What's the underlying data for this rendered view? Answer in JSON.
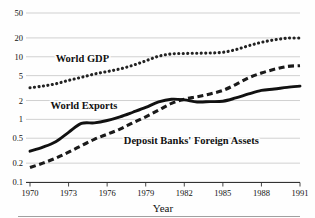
{
  "figure": {
    "caption_clipped": "",
    "footer_rule": true
  },
  "chart_data": {
    "type": "line",
    "title": "",
    "xlabel": "Year",
    "ylabel": "",
    "yscale": "log",
    "ylim": [
      0.1,
      50
    ],
    "xlim": [
      1970,
      1991
    ],
    "grid": true,
    "grid_axis": "y",
    "legend": "inline-labels",
    "yticks": [
      0.1,
      0.2,
      0.5,
      1,
      2,
      5,
      10,
      20,
      50
    ],
    "ytick_labels": [
      "0.1",
      "0.2",
      "0.5",
      "1",
      "2",
      "5",
      "10",
      "20",
      "50"
    ],
    "xticks": [
      1970,
      1973,
      1976,
      1979,
      1982,
      1985,
      1988,
      1991
    ],
    "xtick_labels": [
      "1970",
      "1973",
      "1976",
      "1979",
      "1982",
      "1985",
      "1988",
      "1991"
    ],
    "x": [
      1970,
      1971,
      1972,
      1973,
      1974,
      1975,
      1976,
      1977,
      1978,
      1979,
      1980,
      1981,
      1982,
      1983,
      1984,
      1985,
      1986,
      1987,
      1988,
      1989,
      1990,
      1991
    ],
    "series": [
      {
        "name": "World GDP",
        "style": "dotted",
        "color": "#222222",
        "label_x": 1972.0,
        "label_y": 8.2,
        "values": [
          3.2,
          3.4,
          3.7,
          4.2,
          4.7,
          5.3,
          5.8,
          6.4,
          7.3,
          8.6,
          10.2,
          11.1,
          11.3,
          11.4,
          11.5,
          11.8,
          13.0,
          15.0,
          17.0,
          18.6,
          19.8,
          20.0
        ]
      },
      {
        "name": "Deposit Banks' Foreign Assets",
        "style": "dashed",
        "color": "#1a1a1a",
        "label_x": 1977.3,
        "label_y": 0.4,
        "values": [
          0.17,
          0.2,
          0.24,
          0.3,
          0.38,
          0.48,
          0.58,
          0.7,
          0.88,
          1.1,
          1.4,
          1.8,
          2.1,
          2.3,
          2.55,
          2.9,
          3.6,
          4.6,
          5.5,
          6.3,
          7.0,
          7.2
        ]
      },
      {
        "name": "World Exports",
        "style": "solid",
        "color": "#111111",
        "label_x": 1971.6,
        "label_y": 1.45,
        "values": [
          0.31,
          0.36,
          0.44,
          0.62,
          0.86,
          0.88,
          0.96,
          1.1,
          1.3,
          1.55,
          1.9,
          2.1,
          2.05,
          1.9,
          1.92,
          1.95,
          2.2,
          2.55,
          2.9,
          3.05,
          3.25,
          3.4
        ]
      }
    ],
    "series_labels": [
      "World GDP",
      "World Exports",
      "Deposit Banks' Foreign Assets"
    ]
  }
}
